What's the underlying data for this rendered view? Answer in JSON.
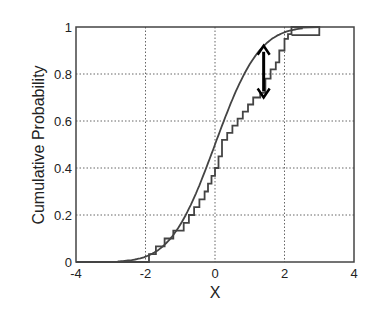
{
  "chart_data": {
    "type": "line",
    "title": "",
    "xlabel": "X",
    "ylabel": "Cumulative Probability",
    "xlim": [
      -4,
      4
    ],
    "ylim": [
      0,
      1
    ],
    "xticks": [
      -4,
      -2,
      0,
      2,
      4
    ],
    "yticks": [
      0,
      0.2,
      0.4,
      0.6,
      0.8,
      1
    ],
    "xtick_labels": [
      "-4",
      "-2",
      "0",
      "2",
      "4"
    ],
    "ytick_labels": [
      "0",
      "0.2",
      "0.4",
      "0.6",
      "0.8",
      "1"
    ],
    "grid": true,
    "grid_style": "dotted",
    "series": [
      {
        "name": "Theoretical CDF",
        "kind": "smooth",
        "description": "Standard normal CDF",
        "mean": 0,
        "std": 1,
        "x": [
          -4,
          -3,
          -2.5,
          -2,
          -1.5,
          -1,
          -0.5,
          0,
          0.5,
          1,
          1.5,
          2,
          2.5,
          3
        ],
        "y": [
          0,
          0.001,
          0.006,
          0.023,
          0.067,
          0.159,
          0.309,
          0.5,
          0.691,
          0.841,
          0.933,
          0.977,
          0.994,
          1.0
        ]
      },
      {
        "name": "Empirical CDF",
        "kind": "step",
        "x": [
          -4,
          -1.9,
          -1.7,
          -1.45,
          -1.2,
          -0.9,
          -0.75,
          -0.6,
          -0.45,
          -0.3,
          -0.2,
          -0.1,
          0.0,
          0.1,
          0.2,
          0.35,
          0.5,
          0.65,
          0.8,
          0.95,
          1.1,
          1.3,
          1.45,
          1.6,
          1.75,
          1.85,
          2.0,
          2.1,
          2.2,
          3.0
        ],
        "y": [
          0,
          0.033,
          0.067,
          0.1,
          0.133,
          0.167,
          0.2,
          0.233,
          0.267,
          0.3,
          0.333,
          0.367,
          0.4,
          0.45,
          0.52,
          0.55,
          0.58,
          0.61,
          0.64,
          0.67,
          0.7,
          0.72,
          0.78,
          0.82,
          0.85,
          0.9,
          0.95,
          0.97,
          1.0,
          1.0
        ]
      }
    ],
    "annotations": [
      {
        "type": "double-arrow",
        "description": "Maximum vertical distance (KS statistic)",
        "x": 1.4,
        "y_from": 0.7,
        "y_to": 0.92
      }
    ]
  },
  "labels": {
    "xlabel": "X",
    "ylabel": "Cumulative Probability",
    "xticks": [
      "-4",
      "-2",
      "0",
      "2",
      "4"
    ],
    "yticks": [
      "0",
      "0.2",
      "0.4",
      "0.6",
      "0.8",
      "1"
    ]
  }
}
